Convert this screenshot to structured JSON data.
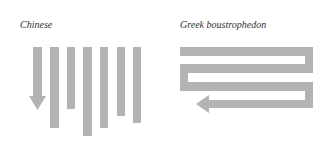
{
  "panels": [
    {
      "title": "Chinese",
      "direction": "top-to-bottom columns, right to left",
      "color": "#b3b3b3"
    },
    {
      "title": "Greek boustrophedon",
      "direction": "alternating left-to-right and right-to-left lines",
      "color": "#b3b3b3"
    }
  ],
  "colors": {
    "shape": "#b3b3b3",
    "text": "#333333",
    "background": "#ffffff"
  }
}
